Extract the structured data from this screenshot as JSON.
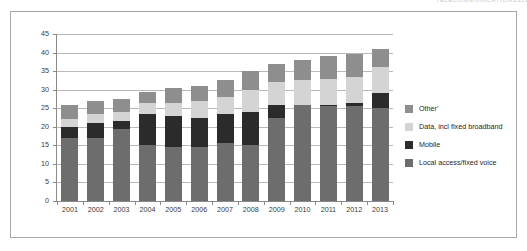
{
  "header": {
    "running_head": "TELECOMMUNICATIONS",
    "page_number": "213"
  },
  "chart_data": {
    "type": "bar",
    "stacked": true,
    "title": "",
    "subtitle": "",
    "xlabel": "",
    "ylabel": "",
    "ylim": [
      0,
      45
    ],
    "ytick_values": [
      0,
      5,
      10,
      15,
      20,
      25,
      30,
      35,
      40,
      45
    ],
    "ytick_labels": [
      "0",
      "5",
      "10",
      "15",
      "20",
      "25",
      "30",
      "35",
      "40",
      "45"
    ],
    "grid": true,
    "legend_position": "right",
    "categories": [
      "2001",
      "2002",
      "2003",
      "2004",
      "2005",
      "2006",
      "2007",
      "2008",
      "2009",
      "2010",
      "2011",
      "2012",
      "2013"
    ],
    "series": [
      {
        "name": "Local access/fixed voice",
        "color": "#6d6d6d",
        "values": [
          17.0,
          17.0,
          19.5,
          15.0,
          14.5,
          14.5,
          15.5,
          15.0,
          22.5,
          26.0,
          25.5,
          25.5,
          25.0
        ]
      },
      {
        "name": "Mobile",
        "color": "#2b2b2b",
        "values": [
          3.0,
          4.0,
          2.0,
          8.5,
          8.5,
          8.0,
          8.0,
          9.0,
          3.5,
          0.0,
          0.5,
          1.0,
          4.0
        ]
      },
      {
        "name": "Data, incl fixed broadband",
        "color": "#d4d4d4",
        "values": [
          2.0,
          2.5,
          2.5,
          3.0,
          3.5,
          4.5,
          4.5,
          6.0,
          6.0,
          6.5,
          7.0,
          7.0,
          7.0
        ]
      },
      {
        "name": "Other'",
        "color": "#8e8e8e",
        "values": [
          4.0,
          3.5,
          3.5,
          3.0,
          4.0,
          4.0,
          4.5,
          5.0,
          5.0,
          5.5,
          6.0,
          6.0,
          5.0
        ]
      }
    ],
    "totals": [
      26.0,
      27.0,
      27.5,
      29.5,
      30.5,
      31.0,
      32.5,
      35.0,
      37.0,
      38.0,
      39.0,
      39.5,
      41.0
    ],
    "legend_entries": [
      {
        "label": "Other'",
        "color": "#8e8e8e"
      },
      {
        "label": "Data, incl fixed broadband",
        "color": "#d4d4d4"
      },
      {
        "label": "Mobile",
        "color": "#2b2b2b"
      },
      {
        "label": "Local access/fixed voice",
        "color": "#6d6d6d"
      }
    ]
  }
}
